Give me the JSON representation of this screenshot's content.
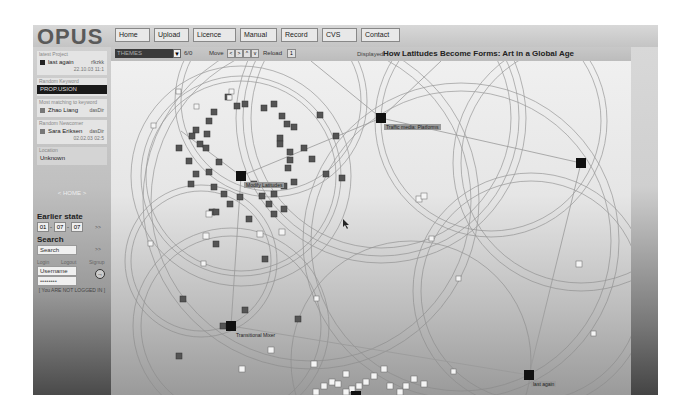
{
  "app": {
    "logo": "OPUS"
  },
  "nav": {
    "items": [
      {
        "label": "Home",
        "width": 34
      },
      {
        "label": "Upload",
        "width": 34
      },
      {
        "label": "Licence",
        "width": 34
      },
      {
        "label": "Manual",
        "width": 34
      },
      {
        "label": "Record",
        "width": 34
      },
      {
        "label": "CVS",
        "width": 34
      },
      {
        "label": "Contact",
        "width": 34
      }
    ]
  },
  "toolbar": {
    "theme_select": "THEMES",
    "theme_arrow": "▼",
    "theme_count": "6/0",
    "move_label": "Move",
    "move_buttons": [
      "<",
      ">",
      "^",
      "v"
    ],
    "reload_label": "Reload",
    "reload_value": "1",
    "displayed_label": "Displayed:",
    "displayed_title": "How Latitudes Become Forms: Art in a Global Age"
  },
  "sidebar": {
    "latest_project": {
      "label": "latest Project",
      "name": "last again",
      "right": "rfkzkk",
      "date": "22.10.03 11:1"
    },
    "random_keyword": {
      "label": "Random Keyword",
      "value": "PROP.USION"
    },
    "most_matching": {
      "label": "Most matching to keyword",
      "name": "Zhao Liang",
      "right": "dasDir"
    },
    "random_newcomer": {
      "label": "Random Newcomer",
      "name": "Sara Eriksen",
      "right": "dasDir",
      "date": "02.02.03 02:5"
    },
    "location": {
      "label": "Location",
      "value": "Unknown"
    },
    "home_link": "< HOME >",
    "earlier_state": {
      "title": "Earlier state",
      "day": "01",
      "month": "07",
      "year": "07",
      "go": ">>"
    },
    "search": {
      "title": "Search",
      "value": "Search",
      "go": ">>"
    },
    "links": [
      "Login",
      "Logout",
      "Signup"
    ],
    "login": {
      "username": "Username",
      "password": "••••••••",
      "button": "→"
    },
    "login_status": "[ You ARE NOT LOGGED IN ]"
  },
  "graph": {
    "hubs": [
      {
        "label": "Modify Latitudes",
        "x": 130,
        "y": 115
      },
      {
        "label": "Traffic media: Platforms",
        "x": 270,
        "y": 57
      },
      {
        "label": "",
        "x": 470,
        "y": 102
      },
      {
        "label": "Transitional Mixer",
        "x": 120,
        "y": 265
      },
      {
        "label": "last again",
        "x": 418,
        "y": 314
      }
    ]
  },
  "colors": {
    "screen_bg": "#b8b8b8",
    "graph_bg": "#eeeeee",
    "hub": "#111111",
    "node_dark": "#555555"
  }
}
